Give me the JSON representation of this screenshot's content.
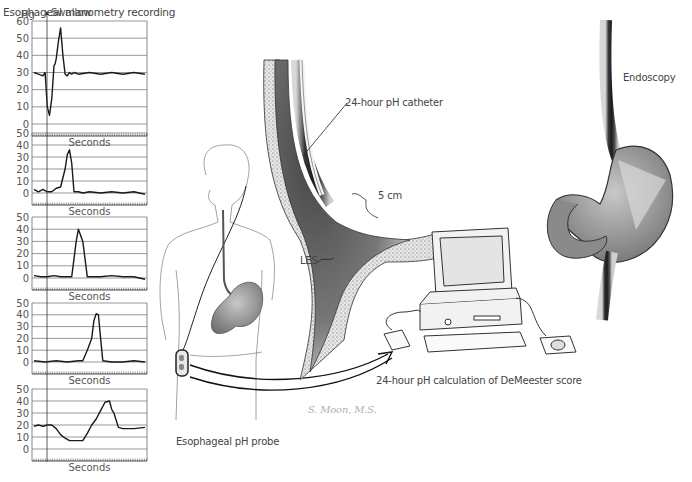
{
  "title": "Esophageal manometry recording",
  "labels": {
    "unit": "Hg",
    "swallow": "Swallow",
    "seconds": "Seconds",
    "catheter": "24-hour pH catheter",
    "five_cm": "5 cm",
    "les": "LES",
    "endoscopy": "Endoscopy",
    "computer": "24-hour pH calculation of DeMeester score",
    "probe": "Esophageal pH probe",
    "signature": "S. Moon, M.S."
  },
  "colors": {
    "trace": "#1a1a1a",
    "grid": "#6a6a6a",
    "text": "#444444"
  },
  "chart_data": [
    {
      "type": "line",
      "title": "Esophageal manometry recording - panel 1 (upper esophageal sphincter)",
      "xlabel": "Seconds",
      "ylabel": "Hg",
      "ylim": [
        0,
        60
      ],
      "yticks": [
        0,
        10,
        20,
        30,
        40,
        50,
        60
      ],
      "grid": true,
      "annotation": "Swallow",
      "x": [
        0,
        4,
        8,
        10,
        12,
        14,
        16,
        18,
        19,
        20,
        22,
        24,
        26,
        28,
        30,
        32,
        34,
        36,
        40,
        50,
        60,
        70,
        80,
        90,
        100
      ],
      "values": [
        30,
        29,
        28,
        30,
        10,
        5,
        15,
        34,
        35,
        38,
        48,
        56,
        40,
        29,
        28,
        30,
        29,
        30,
        29,
        30,
        29,
        30,
        29,
        30,
        29
      ]
    },
    {
      "type": "line",
      "title": "Panel 2",
      "xlabel": "Seconds",
      "ylim": [
        0,
        50
      ],
      "yticks": [
        0,
        10,
        20,
        30,
        40,
        50
      ],
      "grid": true,
      "x": [
        0,
        4,
        8,
        12,
        16,
        20,
        24,
        28,
        30,
        32,
        34,
        36,
        38,
        40,
        44,
        50,
        60,
        70,
        80,
        90,
        100
      ],
      "values": [
        3,
        1,
        3,
        1,
        1,
        4,
        5,
        20,
        32,
        36,
        25,
        1,
        1,
        1,
        0,
        1,
        0,
        1,
        0,
        1,
        -1
      ]
    },
    {
      "type": "line",
      "title": "Panel 3",
      "xlabel": "Seconds",
      "ylim": [
        0,
        50
      ],
      "yticks": [
        0,
        10,
        20,
        30,
        40,
        50
      ],
      "grid": true,
      "x": [
        0,
        6,
        12,
        18,
        24,
        30,
        34,
        38,
        40,
        44,
        48,
        52,
        60,
        70,
        80,
        90,
        100
      ],
      "values": [
        2,
        1,
        1,
        2,
        1,
        1,
        1,
        30,
        40,
        30,
        1,
        1,
        1,
        2,
        1,
        1,
        -1
      ]
    },
    {
      "type": "line",
      "title": "Panel 4",
      "xlabel": "Seconds",
      "ylim": [
        0,
        50
      ],
      "yticks": [
        0,
        10,
        20,
        30,
        40,
        50
      ],
      "grid": true,
      "x": [
        0,
        10,
        20,
        30,
        40,
        44,
        48,
        52,
        54,
        56,
        58,
        60,
        62,
        70,
        80,
        90,
        100
      ],
      "values": [
        1,
        0,
        1,
        0,
        1,
        1,
        10,
        20,
        35,
        41,
        40,
        20,
        1,
        0,
        0,
        1,
        0
      ]
    },
    {
      "type": "line",
      "title": "Panel 5 (lower esophageal sphincter)",
      "xlabel": "Seconds",
      "ylim": [
        0,
        50
      ],
      "yticks": [
        0,
        10,
        20,
        30,
        40,
        50
      ],
      "grid": true,
      "x": [
        0,
        4,
        8,
        12,
        16,
        20,
        24,
        28,
        32,
        36,
        40,
        44,
        48,
        52,
        56,
        60,
        64,
        68,
        70,
        72,
        76,
        80,
        90,
        100
      ],
      "values": [
        19,
        20,
        19,
        20,
        20,
        17,
        12,
        9,
        7,
        7,
        7,
        7,
        13,
        20,
        25,
        32,
        39,
        40,
        33,
        30,
        18,
        17,
        17,
        18
      ]
    }
  ]
}
